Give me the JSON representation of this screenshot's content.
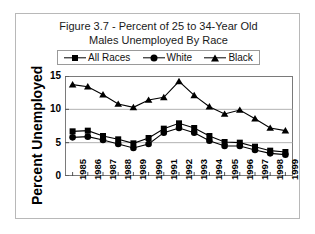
{
  "figure": {
    "title_line1": "Figure 3.7 - Percent of 25 to 34-Year Old",
    "title_line2": "Males Unemployed By Race",
    "border_color": "#b8b8b8",
    "background": "#ffffff",
    "series_color": "#000000"
  },
  "chart_data": {
    "type": "line",
    "title": "Figure 3.7 - Percent of 25 to 34-Year Old Males Unemployed By Race",
    "xlabel": "",
    "ylabel": "Percent Unemployed",
    "categories": [
      "1985",
      "1986",
      "1987",
      "1988",
      "1989",
      "1990",
      "1991",
      "1992",
      "1993",
      "1994",
      "1995",
      "1996",
      "1997",
      "1998",
      "1999"
    ],
    "x": [
      1985,
      1986,
      1987,
      1988,
      1989,
      1990,
      1991,
      1992,
      1993,
      1994,
      1995,
      1996,
      1997,
      1998,
      1999
    ],
    "series": [
      {
        "name": "All Races",
        "marker": "square",
        "values": [
          6.7,
          6.8,
          6.0,
          5.5,
          4.9,
          5.7,
          7.1,
          7.9,
          7.2,
          6.0,
          5.1,
          5.0,
          4.4,
          3.8,
          3.6
        ]
      },
      {
        "name": "White",
        "marker": "circle",
        "values": [
          5.8,
          5.9,
          5.4,
          4.8,
          4.2,
          4.8,
          6.5,
          7.2,
          6.5,
          5.3,
          4.5,
          4.5,
          3.9,
          3.4,
          3.2
        ]
      },
      {
        "name": "Black",
        "marker": "triangle",
        "values": [
          13.7,
          13.4,
          12.2,
          10.8,
          10.3,
          11.4,
          11.8,
          14.2,
          12.1,
          10.4,
          9.3,
          9.9,
          8.6,
          7.2,
          6.8
        ]
      }
    ],
    "ylim": [
      0,
      15
    ],
    "yticks": [
      0,
      5,
      10,
      15
    ],
    "ytick_labels": [
      "0",
      "5",
      "10",
      "15"
    ],
    "grid": "horizontal",
    "legend_position": "top",
    "legend_entries": [
      "All Races",
      "White",
      "Black"
    ]
  }
}
